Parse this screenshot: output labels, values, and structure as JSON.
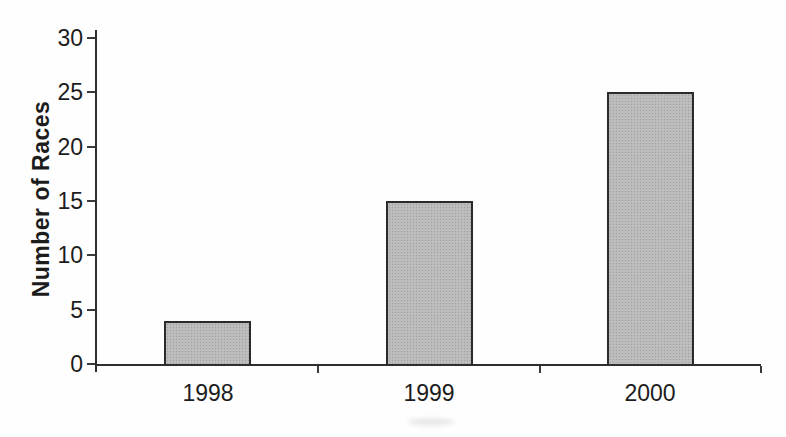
{
  "chart_data": {
    "type": "bar",
    "title": "",
    "categories": [
      "1998",
      "1999",
      "2000"
    ],
    "values": [
      4,
      15,
      25
    ],
    "xlabel": "",
    "ylabel": "Number of Races",
    "ylim": [
      0,
      30
    ],
    "yticks": [
      0,
      5,
      10,
      15,
      20,
      25,
      30
    ],
    "grid": false,
    "legend": false,
    "bar_fill_color": "#bcbcbc",
    "bar_border_color": "#2b2b2b",
    "axis_color": "#2e2e2e",
    "text_color": "#1c1c1c",
    "background_color": "#fefefe"
  }
}
